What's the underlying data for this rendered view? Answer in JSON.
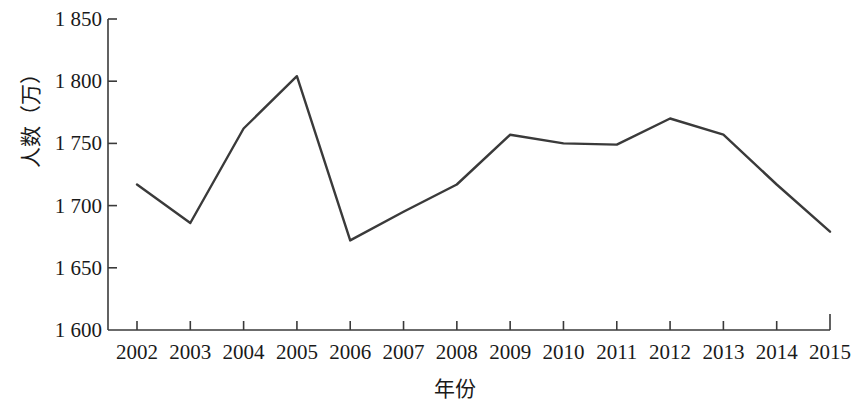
{
  "chart_data": {
    "type": "line",
    "title": "",
    "xlabel": "年份",
    "ylabel": "人数（万）",
    "categories": [
      "2002",
      "2003",
      "2004",
      "2005",
      "2006",
      "2007",
      "2008",
      "2009",
      "2010",
      "2011",
      "2012",
      "2013",
      "2014",
      "2015"
    ],
    "values": [
      1717,
      1686,
      1762,
      1804,
      1672,
      1695,
      1717,
      1757,
      1750,
      1749,
      1770,
      1757,
      1717,
      1679
    ],
    "series": [
      {
        "name": "人数（万）",
        "values": [
          1717,
          1686,
          1762,
          1804,
          1672,
          1695,
          1717,
          1757,
          1750,
          1749,
          1770,
          1757,
          1717,
          1679
        ]
      }
    ],
    "ylim": [
      1600,
      1850
    ],
    "ytick_values": [
      1850,
      1800,
      1750,
      1700,
      1650,
      1600
    ],
    "ytick_labels": [
      "1 850",
      "1 800",
      "1 750",
      "1 700",
      "1 650",
      "1 600"
    ],
    "grid": false,
    "legend": "none",
    "line_color": "#3a3a3a",
    "axis_color": "#3a3a3a",
    "markers": false
  }
}
